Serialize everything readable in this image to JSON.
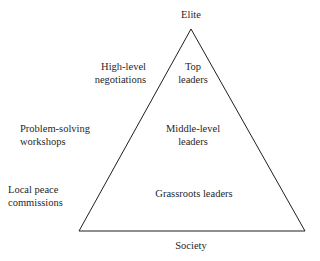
{
  "figure": {
    "type": "pyramid-diagram",
    "background_color": "#ffffff",
    "line_color": "#1f1f1f",
    "text_color": "#1f1f1f"
  },
  "axis_labels": {
    "top": "Elite",
    "bottom": "Society"
  },
  "approaches": [
    {
      "text": "High-level\nnegotiations"
    },
    {
      "text": "Problem-solving\nworkshops"
    },
    {
      "text": "Local peace\ncommissions"
    }
  ],
  "levels": [
    {
      "text": "Top\nleaders"
    },
    {
      "text": "Middle-level\nleaders"
    },
    {
      "text": "Grassroots leaders"
    }
  ],
  "geometry": {
    "apex_x": 191,
    "apex_y": 29,
    "base_left_x": 79,
    "base_right_x": 305,
    "base_y": 231,
    "stroke_width": 1
  }
}
